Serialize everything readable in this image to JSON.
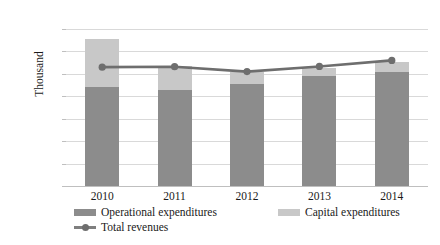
{
  "chart_data": {
    "type": "bar",
    "title": "",
    "subtitle": "",
    "xlabel": "",
    "ylabel": "Thousand",
    "categories": [
      "2010",
      "2011",
      "2012",
      "2013",
      "2014"
    ],
    "ylim": [
      0,
      70000
    ],
    "ytick_values": [
      70000,
      60000,
      50000,
      40000,
      30000,
      20000,
      10000,
      0
    ],
    "ytick_labels": [
      "70 000",
      "60 000",
      "50 000",
      "40 000",
      "30 000",
      "20 000",
      "10 000",
      "0"
    ],
    "grid": true,
    "legend_position": "bottom",
    "stacked": true,
    "series": [
      {
        "name": "Operational expenditures",
        "type": "bar",
        "color": "#8c8c8c",
        "values": [
          44000,
          43000,
          45500,
          49000,
          51000
        ]
      },
      {
        "name": "Capital expenditures",
        "type": "bar",
        "color": "#c8c8c8",
        "values": [
          21500,
          10500,
          5500,
          3500,
          4500
        ]
      },
      {
        "name": "Total revenues",
        "type": "line",
        "color": "#6e6e6e",
        "values": [
          53000,
          53200,
          51000,
          53300,
          56000
        ]
      }
    ]
  },
  "legend": {
    "items": [
      {
        "label": "Operational expenditures",
        "marker": "square-swatch-dark"
      },
      {
        "label": "Capital expenditures",
        "marker": "square-swatch-light"
      },
      {
        "label": "Total revenues",
        "marker": "line-with-dot-marker"
      }
    ]
  },
  "colors": {
    "operational": "#8c8c8c",
    "capital": "#c8c8c8",
    "revenue_line": "#6e6e6e",
    "gridline": "#d9d9d9",
    "axis": "#bfbfbf",
    "text": "#1a1a1a",
    "background": "#ffffff"
  }
}
